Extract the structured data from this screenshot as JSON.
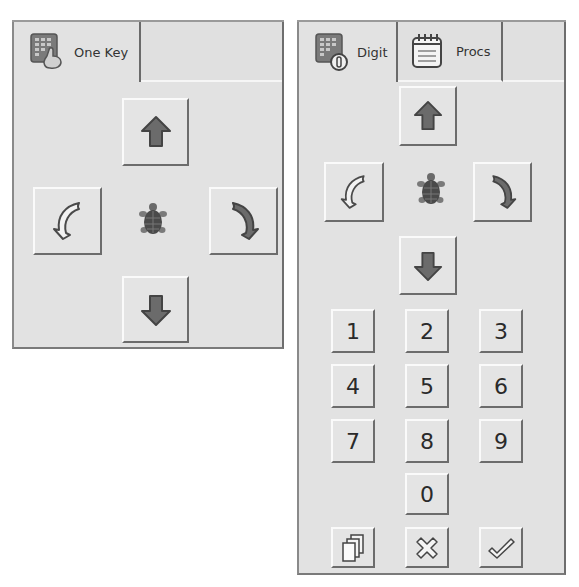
{
  "left_panel": {
    "tabs": [
      {
        "label": "One Key",
        "icon": "keypad-hand-icon",
        "active": true
      }
    ],
    "controls": {
      "up": "arrow-up-icon",
      "left": "rotate-left-icon",
      "turtle": "turtle-icon",
      "right": "rotate-right-icon",
      "down": "arrow-down-icon"
    }
  },
  "right_panel": {
    "tabs": [
      {
        "label": "Digit",
        "icon": "keypad-digit-icon",
        "active": true
      },
      {
        "label": "Procs",
        "icon": "notepad-icon",
        "active": false
      }
    ],
    "controls": {
      "up": "arrow-up-icon",
      "left": "rotate-left-icon",
      "turtle": "turtle-icon",
      "right": "rotate-right-icon",
      "down": "arrow-down-icon"
    },
    "digits": [
      "1",
      "2",
      "3",
      "4",
      "5",
      "6",
      "7",
      "8",
      "9",
      "0"
    ],
    "actions": [
      {
        "name": "copy",
        "icon": "copy-pages-icon"
      },
      {
        "name": "cancel",
        "icon": "x-icon"
      },
      {
        "name": "confirm",
        "icon": "checkmark-icon"
      }
    ]
  },
  "colors": {
    "panel_bg": "#e2e2e2",
    "arrow_fill": "#6b6b6b",
    "arrow_stroke": "#4a4a4a",
    "turtle": "#5a5a5a"
  }
}
